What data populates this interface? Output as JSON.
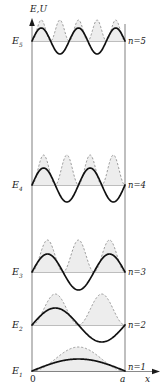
{
  "figure": {
    "kind": "physics-diagram",
    "background": "#ffffff",
    "width": 165,
    "height": 392
  },
  "axes": {
    "vertical_label": "E,U",
    "horizontal_label": "x",
    "origin_label": "0",
    "width_label": "a",
    "axis_color": "#8a8a8a",
    "x_left_px": 32,
    "x_right_px": 125,
    "y_top_px": 22,
    "y_bottom_px": 372
  },
  "chart_data": {
    "type": "line",
    "title": "",
    "xlabel": "x",
    "ylabel": "E,U",
    "xlim": [
      0,
      1
    ],
    "ylim": [
      0,
      1
    ],
    "xtick_labels": [
      "0",
      "a"
    ],
    "grid": false,
    "legend": "none",
    "series": [
      {
        "name": "n=5",
        "quantum_number": 5,
        "level_label": "E",
        "level_subscript": "5",
        "right_label": "n=5",
        "baseline_y_px": 41,
        "psi_amplitude_px": 13,
        "prob_amplitude_px": 21,
        "nodes_interior": 4,
        "wave_color": "#111111",
        "prob_color": "#8f8f8f",
        "prob_fill": "#ededed"
      },
      {
        "name": "n=4",
        "quantum_number": 4,
        "level_label": "E",
        "level_subscript": "4",
        "right_label": "n=4",
        "baseline_y_px": 185,
        "psi_amplitude_px": 17,
        "prob_amplitude_px": 30,
        "nodes_interior": 3,
        "wave_color": "#111111",
        "prob_color": "#8f8f8f",
        "prob_fill": "#ededed"
      },
      {
        "name": "n=3",
        "quantum_number": 3,
        "level_label": "E",
        "level_subscript": "3",
        "right_label": "n=3",
        "baseline_y_px": 272,
        "psi_amplitude_px": 18,
        "prob_amplitude_px": 32,
        "nodes_interior": 2,
        "wave_color": "#111111",
        "prob_color": "#8f8f8f",
        "prob_fill": "#ededed"
      },
      {
        "name": "n=2",
        "quantum_number": 2,
        "level_label": "E",
        "level_subscript": "2",
        "right_label": "n=2",
        "baseline_y_px": 325,
        "psi_amplitude_px": 17,
        "prob_amplitude_px": 31,
        "nodes_interior": 1,
        "wave_color": "#111111",
        "prob_color": "#8f8f8f",
        "prob_fill": "#ededed"
      },
      {
        "name": "n=1",
        "quantum_number": 1,
        "level_label": "E",
        "level_subscript": "1",
        "right_label": "n=1",
        "baseline_y_px": 371,
        "psi_amplitude_px": 12,
        "prob_amplitude_px": 24,
        "nodes_interior": 0,
        "wave_color": "#111111",
        "prob_color": "#8f8f8f",
        "prob_fill": "#ededed"
      }
    ]
  },
  "labels": {
    "axis_vertical": "E,U",
    "axis_horizontal": "x",
    "tick_zero": "0",
    "tick_a": "a",
    "e5": "E",
    "e5_sub": "5",
    "n5": "n=5",
    "e4": "E",
    "e4_sub": "4",
    "n4": "n=4",
    "e3": "E",
    "e3_sub": "3",
    "n3": "n=3",
    "e2": "E",
    "e2_sub": "2",
    "n2": "n=2",
    "e1": "E",
    "e1_sub": "1",
    "n1": "n=1"
  }
}
